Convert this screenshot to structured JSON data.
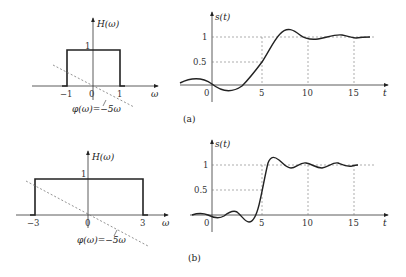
{
  "figure": {
    "panels": [
      {
        "id": "a",
        "caption": "(a)",
        "spectrum": {
          "y_label": "H(ω)",
          "x_label": "ω",
          "amplitude_label": "1",
          "ticks": [
            "−1",
            "0",
            "1"
          ],
          "cutoff": 1,
          "phase_label": "φ(ω)=−5ω"
        },
        "response": {
          "y_label": "s(t)",
          "x_label": "t",
          "y_ticks": [
            "1",
            "0.5"
          ],
          "x_ticks": [
            "0",
            "5",
            "10",
            "15"
          ]
        }
      },
      {
        "id": "b",
        "caption": "(b)",
        "spectrum": {
          "y_label": "H(ω)",
          "x_label": "ω",
          "amplitude_label": "1",
          "ticks": [
            "−3",
            "0",
            "3"
          ],
          "cutoff": 3,
          "phase_label": "φ(ω)=−5ω"
        },
        "response": {
          "y_label": "s(t)",
          "x_label": "t",
          "y_ticks": [
            "1",
            "0.5"
          ],
          "x_ticks": [
            "0",
            "5",
            "10",
            "15"
          ]
        }
      }
    ]
  },
  "colors": {
    "line": "#222222",
    "dashed": "#777777"
  }
}
